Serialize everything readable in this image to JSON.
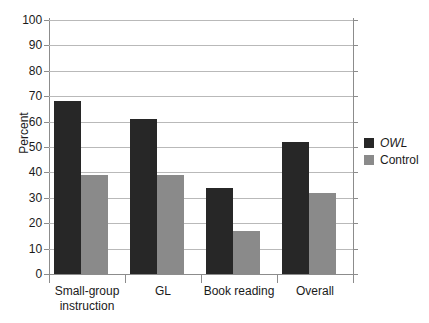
{
  "chart_data": {
    "type": "bar",
    "title": "",
    "subtitle": "",
    "xlabel": "",
    "ylabel": "Percent",
    "ylim": [
      0,
      100
    ],
    "ytick_step": 10,
    "yticks": [
      100,
      90,
      80,
      70,
      60,
      50,
      40,
      30,
      20,
      10,
      0
    ],
    "ytick_labels": [
      "100",
      "90",
      "80",
      "70",
      "60",
      "50",
      "40",
      "30",
      "20",
      "10",
      "0"
    ],
    "grid": true,
    "grid_axis": "y",
    "legend_position": "right",
    "categories": [
      "Small-group\ninstruction",
      "GL",
      "Book reading",
      "Overall"
    ],
    "category_labels": [
      "Small-group\ninstruction",
      "GL",
      "Book reading",
      "Overall"
    ],
    "series": [
      {
        "name": "OWL",
        "color": "#272727",
        "italic": true,
        "values": [
          68,
          61,
          34,
          52
        ]
      },
      {
        "name": "Control",
        "color": "#8a8a8a",
        "italic": false,
        "values": [
          39,
          39,
          17,
          32
        ]
      }
    ]
  },
  "legend": {
    "items": [
      {
        "label": "OWL",
        "color": "#272727"
      },
      {
        "label": "Control",
        "color": "#8a8a8a"
      }
    ]
  },
  "axes": {
    "y_title": "Percent"
  },
  "colors": {
    "owl": "#272727",
    "control": "#8a8a8a",
    "gridline": "#b9b9b9",
    "axis": "#8c8c8c",
    "text": "#1a1a1a",
    "background": "#ffffff"
  }
}
